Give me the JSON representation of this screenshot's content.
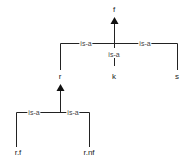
{
  "diagram": {
    "type": "is-a hierarchy",
    "nodes": {
      "f": "f",
      "r": "r",
      "k": "k",
      "s": "s",
      "rf": "r.f",
      "rnf": "r.nf"
    },
    "edges": [
      {
        "from": "r",
        "to": "f",
        "label": "is-a"
      },
      {
        "from": "k",
        "to": "f",
        "label": "is-a"
      },
      {
        "from": "s",
        "to": "f",
        "label": "is-a"
      },
      {
        "from": "r.f",
        "to": "r",
        "label": "is-a"
      },
      {
        "from": "r.nf",
        "to": "r",
        "label": "is-a"
      }
    ],
    "colors": {
      "line": "#222222",
      "text": "#222222"
    }
  }
}
